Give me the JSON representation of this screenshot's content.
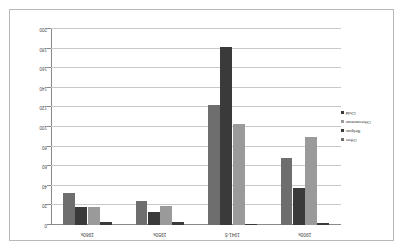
{
  "chart_data": {
    "type": "bar",
    "title": "",
    "xlabel": "",
    "ylabel": "",
    "orientation": "vertical-inverted",
    "rotation_degrees": 180,
    "grid": true,
    "legend_position": "left-middle",
    "ylim": [
      0,
      200
    ],
    "ytick_step": 20,
    "yticks": [
      "0",
      "20",
      "40",
      "60",
      "80",
      "100",
      "120",
      "140",
      "160",
      "180",
      "200"
    ],
    "categories": [
      "1900s",
      "1941-5",
      "1950s",
      "1960s"
    ],
    "series": [
      {
        "name": "Child",
        "color": "#3a3a3a",
        "values": [
          2,
          0,
          3,
          3
        ]
      },
      {
        "name": "Otherwoman",
        "color": "#9a9a9a",
        "values": [
          90,
          103,
          19,
          18
        ]
      },
      {
        "name": "Belgian",
        "color": "#3a3a3a",
        "values": [
          38,
          182,
          13,
          18
        ]
      },
      {
        "name": "Other",
        "color": "#6e6e6e",
        "values": [
          68,
          122,
          24,
          33
        ]
      }
    ]
  },
  "legend": {
    "items": [
      {
        "label": "Other",
        "color": "#6e6e6e"
      },
      {
        "label": "Belgian",
        "color": "#3a3a3a"
      },
      {
        "label": "Otherwoman",
        "color": "#9a9a9a"
      },
      {
        "label": "Child",
        "color": "#3a3a3a"
      }
    ]
  },
  "colors": {
    "frame": "#b9b9b9",
    "gridline": "#c8c8c8",
    "axis": "#8a8a8a",
    "background": "#ffffff",
    "text": "#3c3c3c"
  }
}
